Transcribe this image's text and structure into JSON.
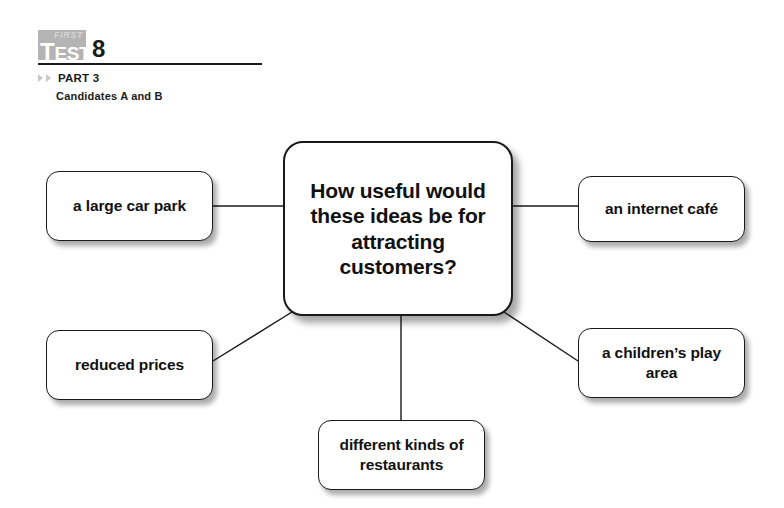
{
  "page": {
    "background": "#ffffff",
    "width": 784,
    "height": 508
  },
  "header": {
    "logo_small": "FIRST",
    "logo_main_cap": "T",
    "logo_main_rest": "EST",
    "test_number": "8",
    "part_label": "PART 3",
    "candidates_label": "Candidates A and B",
    "marker_icon": "triangle-right-icon",
    "logo_badge_color": "#b4b4b4",
    "rule_color": "#1a1a1a"
  },
  "diagram": {
    "type": "mind-map",
    "center": {
      "id": "center",
      "text": "How useful would these ideas be for attracting customers?",
      "x": 283,
      "y": 141,
      "width": 230,
      "height": 175
    },
    "nodes": [
      {
        "id": "car-park",
        "text": "a large car park",
        "x": 46,
        "y": 171,
        "width": 167,
        "height": 70
      },
      {
        "id": "internet-cafe",
        "text": "an internet café",
        "x": 578,
        "y": 176,
        "width": 167,
        "height": 66
      },
      {
        "id": "reduced-prices",
        "text": "reduced prices",
        "x": 46,
        "y": 330,
        "width": 167,
        "height": 70
      },
      {
        "id": "play-area",
        "text": "a children’s play area",
        "x": 578,
        "y": 328,
        "width": 167,
        "height": 70
      },
      {
        "id": "restaurants",
        "text": "different kinds of restaurants",
        "x": 318,
        "y": 420,
        "width": 167,
        "height": 70
      }
    ],
    "connectors": [
      {
        "from": "car-park",
        "to": "center",
        "x1": 213,
        "y1": 206,
        "x2": 283,
        "y2": 206
      },
      {
        "from": "center",
        "to": "internet-cafe",
        "x1": 513,
        "y1": 206,
        "x2": 578,
        "y2": 206
      },
      {
        "from": "reduced-prices",
        "to": "center",
        "x1": 213,
        "y1": 361,
        "x2": 292,
        "y2": 312
      },
      {
        "from": "center",
        "to": "play-area",
        "x1": 504,
        "y1": 312,
        "x2": 578,
        "y2": 361
      },
      {
        "from": "center",
        "to": "restaurants",
        "x1": 401,
        "y1": 316,
        "x2": 401,
        "y2": 420
      }
    ],
    "line_color": "#1a1a1a",
    "node_border_color": "#1a1a1a",
    "node_fill_color": "#ffffff"
  }
}
